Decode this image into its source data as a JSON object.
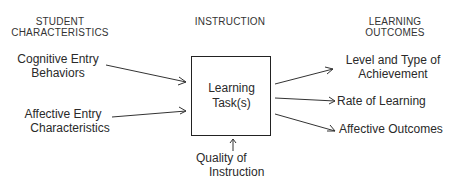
{
  "columns": {
    "student": {
      "line1": "STUDENT",
      "line2": "CHARACTERISTICS"
    },
    "instruction": {
      "line1": "INSTRUCTION"
    },
    "outcomes": {
      "line1": "LEARNING",
      "line2": "OUTCOMES"
    }
  },
  "inputs": [
    {
      "line1": "Cognitive Entry",
      "line2": "Behaviors"
    },
    {
      "line1": "Affective Entry",
      "line2": "Characteristics"
    }
  ],
  "center": {
    "line1": "Learning",
    "line2": "Task(s)"
  },
  "quality": {
    "line1": "Quality of",
    "line2": "Instruction"
  },
  "outputs": [
    {
      "line1": "Level and Type of",
      "line2": "Achievement"
    },
    {
      "line1": "Rate of Learning"
    },
    {
      "line1": "Affective Outcomes"
    }
  ],
  "colors": {
    "line": "#333333",
    "text": "#2a2a2a",
    "background": "#ffffff"
  }
}
